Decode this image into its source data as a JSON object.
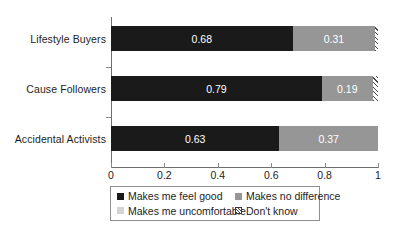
{
  "chart_data": {
    "type": "bar",
    "orientation": "horizontal",
    "stacked": true,
    "normalized": true,
    "title": "",
    "subtitle": "",
    "xlabel": "",
    "ylabel": "",
    "xlim": [
      0,
      1
    ],
    "xticks": [
      "0",
      "0.2",
      "0.4",
      "0.6",
      "0.8",
      "1"
    ],
    "xtick_values": [
      0,
      0.2,
      0.4,
      0.6,
      0.8,
      1
    ],
    "grid": false,
    "legend_position": "bottom",
    "categories": [
      "Lifestyle Buyers",
      "Cause Followers",
      "Accidental Activists"
    ],
    "series": [
      {
        "name": "Makes me feel good",
        "key": "feel_good",
        "color": "#1a1a1a",
        "values": [
          0.68,
          0.79,
          0.63
        ],
        "labels": [
          "0.68",
          "0.79",
          "0.63"
        ]
      },
      {
        "name": "Makes no difference",
        "key": "no_difference",
        "color": "#969696",
        "values": [
          0.31,
          0.19,
          0.37
        ],
        "labels": [
          "0.31",
          "0.19",
          "0.37"
        ]
      },
      {
        "name": "Makes me uncomfortable",
        "key": "uncomfortable",
        "color": "#d4d4d4",
        "values": [
          0.0,
          0.0,
          0.0
        ],
        "labels": [
          "",
          "",
          ""
        ]
      },
      {
        "name": "Don't know",
        "key": "dont_know",
        "color": "hatch",
        "values": [
          0.01,
          0.02,
          0.0
        ],
        "labels": [
          "",
          "",
          ""
        ]
      }
    ]
  },
  "legend": {
    "items": [
      {
        "label": "Makes me feel good",
        "key": "feel_good"
      },
      {
        "label": "Makes no difference",
        "key": "no_difference"
      },
      {
        "label": "Makes me uncomfortable",
        "key": "uncomfortable"
      },
      {
        "label": "Don't know",
        "key": "dont_know"
      }
    ]
  },
  "axis": {
    "line_color": "#6e6e6e"
  }
}
